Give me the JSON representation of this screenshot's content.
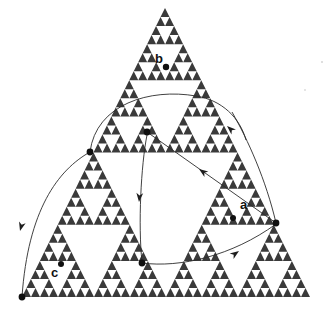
{
  "figure": {
    "kind": "fractal-diagram",
    "background_color": "#ffffff",
    "fractal": {
      "name": "sierpinski-triangle",
      "depth": 5,
      "fill_color": "#3a3a3a",
      "apex": [
        165,
        8
      ],
      "left_vertex": [
        22,
        297
      ],
      "right_vertex": [
        310,
        297
      ]
    },
    "labels": [
      {
        "id": "label-b",
        "text": "b",
        "x": 155,
        "y": 63
      },
      {
        "id": "label-a",
        "text": "a",
        "x": 240,
        "y": 209
      },
      {
        "id": "label-c",
        "text": "c",
        "x": 51,
        "y": 277
      }
    ],
    "points": [
      {
        "id": "point-b",
        "label": "b",
        "x": 166,
        "y": 67,
        "r": 3.2
      },
      {
        "id": "point-a",
        "label": "a",
        "x": 233,
        "y": 218,
        "r": 3.0
      },
      {
        "id": "point-c",
        "label": "c",
        "x": 61,
        "y": 264,
        "r": 3.0
      },
      {
        "id": "point-left-mid",
        "label": "",
        "x": 90,
        "y": 152,
        "r": 3.4
      },
      {
        "id": "point-center-upper",
        "label": "",
        "x": 147,
        "y": 132,
        "r": 3.4
      },
      {
        "id": "point-bottom-center",
        "label": "",
        "x": 142,
        "y": 263,
        "r": 3.4
      },
      {
        "id": "point-right-vertex",
        "label": "",
        "x": 276,
        "y": 223,
        "r": 3.4
      },
      {
        "id": "point-bottom-left-vertex",
        "label": "",
        "x": 22,
        "y": 297,
        "r": 3.4
      }
    ],
    "curves": [
      {
        "id": "curve-top-arc",
        "from": "point-left-mid",
        "to": "point-right-upper",
        "path": "M 90 152 C 96 104 150 88 196 96 C 222 100 240 118 246 140",
        "arrowhead": {
          "x": 227,
          "y": 126,
          "angle": 222
        }
      },
      {
        "id": "curve-right-descend",
        "from": "point-right-upper",
        "to": "point-right-vertex",
        "path": "M 232 112 C 248 140 266 180 276 223",
        "arrowhead": null
      },
      {
        "id": "curve-center-to-right",
        "from": "point-center-upper",
        "to": "point-right-vertex",
        "path": "M 147 132 L 276 223",
        "arrowhead": {
          "x": 199,
          "y": 169,
          "angle": 215
        }
      },
      {
        "id": "curve-center-down",
        "from": "point-center-upper",
        "to": "point-bottom-center",
        "path": "M 147 135 C 141 165 138 225 142 262",
        "arrowhead": {
          "x": 139,
          "y": 202,
          "angle": 95
        }
      },
      {
        "id": "curve-bottom-to-right",
        "from": "point-bottom-center",
        "to": "point-right-vertex",
        "path": "M 142 263 C 180 268 232 256 276 224",
        "arrowhead": {
          "x": 239,
          "y": 251,
          "angle": 325
        }
      },
      {
        "id": "curve-left-down",
        "from": "point-left-mid",
        "to": "point-bottom-left-vertex",
        "path": "M 90 152 C 58 170 28 210 22 297",
        "arrowhead": {
          "x": 20,
          "y": 231,
          "angle": 105
        }
      }
    ]
  }
}
